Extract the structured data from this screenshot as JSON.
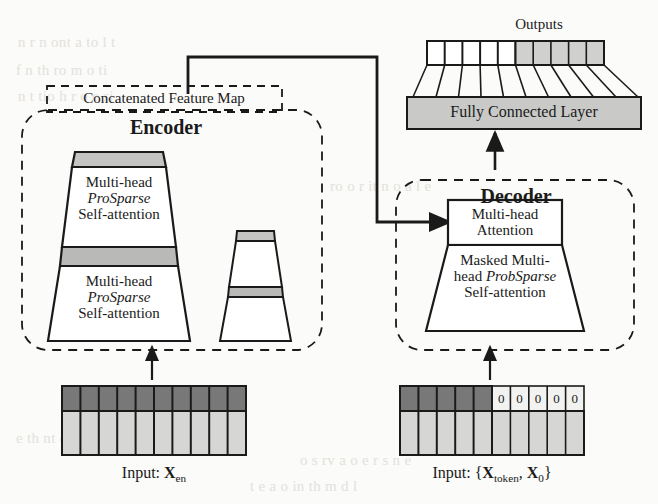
{
  "figure": {
    "colors": {
      "ink": "#1a1a1a",
      "dark_cell": "#787878",
      "light_cell": "#d6d6d4",
      "band_gray": "#b9b9b7",
      "fcl_gray": "#c9c9c7",
      "output_gray": "#d0d0ce",
      "paper": "#fbfbf9",
      "ghost_text": "#e3e1dc"
    }
  },
  "outputs": {
    "label": "Outputs",
    "cell_count": 10,
    "white_cells": 5,
    "gray_cells": 5
  },
  "fully_connected": {
    "label": "Fully Connected Layer",
    "fan_lines": 11
  },
  "concatenated_feature_map": {
    "label": "Concatenated Feature Map"
  },
  "encoder": {
    "title": "Encoder",
    "stacks": [
      {
        "name": "main-stack",
        "blocks": [
          {
            "line1": "Multi-head",
            "line2": "ProSparse",
            "line2_italic": true,
            "line3": "Self-attention"
          },
          {
            "line1": "Multi-head",
            "line2": "ProSparse",
            "line2_italic": true,
            "line3": "Self-attention"
          }
        ]
      },
      {
        "name": "small-stack",
        "blocks": [
          {
            "line1": "",
            "line2": "",
            "line3": ""
          },
          {
            "line1": "",
            "line2": "",
            "line3": ""
          }
        ]
      }
    ]
  },
  "decoder": {
    "title": "Decoder",
    "attention_block": {
      "line1": "Multi-head",
      "line2": "Attention"
    },
    "masked_block": {
      "line1": "Masked Multi-",
      "line2_a": "head ",
      "line2_b": "ProbSparse",
      "line2_b_italic": true,
      "line3": "Self-attention"
    }
  },
  "encoder_input": {
    "caption_prefix": "Input: ",
    "caption_var": "X",
    "caption_sub": "en",
    "columns": 10,
    "dark_columns": 10,
    "zero_labels": []
  },
  "decoder_input": {
    "caption_prefix": "Input: ",
    "caption_open": "{",
    "caption_var1": "X",
    "caption_sub1": "token",
    "caption_sep": ", ",
    "caption_var2": "X",
    "caption_sub2": "0",
    "caption_close": "}",
    "columns": 10,
    "dark_columns": 5,
    "zero_labels": [
      "0",
      "0",
      "0",
      "0",
      "0"
    ]
  },
  "ghost_lines": [
    {
      "text": "n  r  n  ont  a  to  l  t",
      "x": 18,
      "y": 34
    },
    {
      "text": "f  n  th   ro   m  o  ti",
      "x": 16,
      "y": 62
    },
    {
      "text": "n  t  tio    h   r  o  e  si",
      "x": 18,
      "y": 88
    },
    {
      "text": "ro     o  r  it  n   o  a  l   e",
      "x": 330,
      "y": 178
    },
    {
      "text": "e  th  nt  e   s  o  e  ti  f",
      "x": 16,
      "y": 430
    },
    {
      "text": "o  s   rv  a  o  e  r  s  n  e",
      "x": 300,
      "y": 452
    },
    {
      "text": "t  e   a  o  in   th   m  d  l",
      "x": 250,
      "y": 478
    }
  ]
}
